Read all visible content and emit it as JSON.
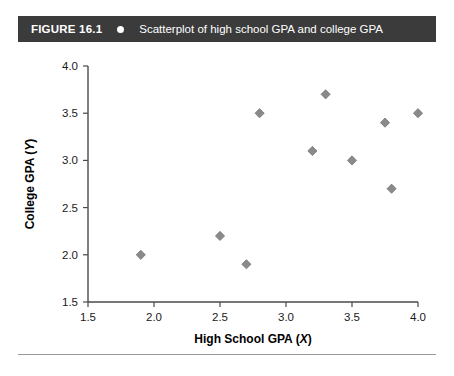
{
  "header": {
    "figure_number": "FIGURE 16.1",
    "bullet_icon": "bullet-dot-icon",
    "caption": "Scatterplot of high school GPA and college GPA",
    "background_color": "#3b3b3b",
    "text_color": "#ffffff"
  },
  "chart_data": {
    "type": "scatter",
    "title": "Scatterplot of high school GPA and college GPA",
    "xlabel": "High School GPA (X)",
    "xlabel_text": "High School GPA (",
    "xlabel_var": "X",
    "xlabel_close": ")",
    "ylabel": "College GPA (Y)",
    "ylabel_text": "College GPA (",
    "ylabel_var": "Y",
    "ylabel_close": ")",
    "xlim": [
      1.5,
      4.0
    ],
    "ylim": [
      1.5,
      4.0
    ],
    "xticks": [
      1.5,
      2.0,
      2.5,
      3.0,
      3.5,
      4.0
    ],
    "yticks": [
      1.5,
      2.0,
      2.5,
      3.0,
      3.5,
      4.0
    ],
    "xtick_labels": [
      "1.5",
      "2.0",
      "2.5",
      "3.0",
      "3.5",
      "4.0"
    ],
    "ytick_labels": [
      "1.5",
      "2.0",
      "2.5",
      "3.0",
      "3.5",
      "4.0"
    ],
    "grid": false,
    "legend": null,
    "marker_shape": "diamond",
    "marker_color": "#8a8a8a",
    "n_points": 10,
    "x": [
      1.9,
      2.5,
      2.7,
      2.8,
      3.2,
      3.3,
      3.5,
      3.75,
      3.8,
      4.0
    ],
    "y": [
      2.0,
      2.2,
      1.9,
      3.5,
      3.1,
      3.7,
      3.0,
      3.4,
      2.7,
      3.5
    ],
    "points": [
      {
        "x": 1.9,
        "y": 2.0
      },
      {
        "x": 2.5,
        "y": 2.2
      },
      {
        "x": 2.7,
        "y": 1.9
      },
      {
        "x": 2.8,
        "y": 3.5
      },
      {
        "x": 3.2,
        "y": 3.1
      },
      {
        "x": 3.3,
        "y": 3.7
      },
      {
        "x": 3.5,
        "y": 3.0
      },
      {
        "x": 3.75,
        "y": 3.4
      },
      {
        "x": 3.8,
        "y": 2.7
      },
      {
        "x": 4.0,
        "y": 3.5
      }
    ]
  }
}
